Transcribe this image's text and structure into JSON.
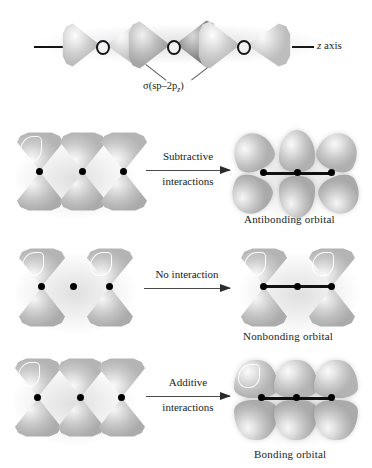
{
  "figure": {
    "accent_color": "#111111",
    "lobe_color": "#c9c9c9",
    "background": "#ffffff"
  },
  "top_row": {
    "name": "sigma-overlap-diagram",
    "axis_label": "z axis",
    "axis_label_italic": "z",
    "orbital_label": "σ(sp–2p",
    "orbital_label_sub": "z",
    "orbital_label_end": ")",
    "orbital_label_full": "σ(sp–2pz)",
    "nuclei_count": 3
  },
  "rows": [
    {
      "id": "subtractive",
      "arrow_label_line1": "Subtractive",
      "arrow_label_line2": "interactions",
      "result_caption": "Antibonding orbital",
      "reactant_orbitals": 3,
      "product_orbitals": 3,
      "product_type": "antibonding"
    },
    {
      "id": "no-interaction",
      "arrow_label_line1": "No interaction",
      "arrow_label_line2": "",
      "result_caption": "Nonbonding orbital",
      "reactant_orbitals": 2,
      "product_orbitals": 2,
      "product_type": "nonbonding"
    },
    {
      "id": "additive",
      "arrow_label_line1": "Additive",
      "arrow_label_line2": "interactions",
      "result_caption": "Bonding orbital",
      "reactant_orbitals": 3,
      "product_orbitals": 3,
      "product_type": "bonding"
    }
  ]
}
